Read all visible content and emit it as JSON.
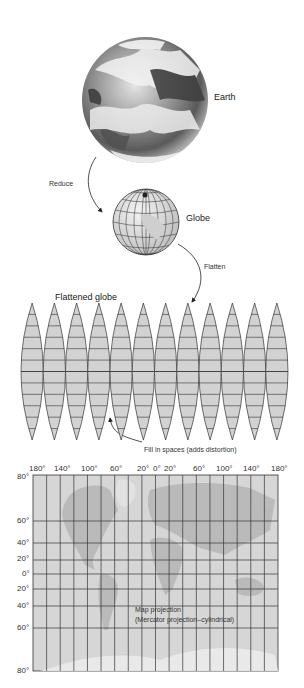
{
  "diagram": {
    "stages": [
      {
        "id": "earth",
        "label": "Earth"
      },
      {
        "id": "globe",
        "label": "Globe"
      },
      {
        "id": "flattened",
        "label": "Flattened globe"
      },
      {
        "id": "projection",
        "label": "Map projection",
        "sublabel": "(Mercator projection–cylindrical)"
      }
    ],
    "arrows": [
      {
        "from": "earth",
        "to": "globe",
        "label": "Reduce"
      },
      {
        "from": "globe",
        "to": "flattened",
        "label": "Flatten"
      },
      {
        "from": "flattened",
        "to": "projection",
        "label": "Fill in spaces (adds distortion)"
      }
    ]
  },
  "gores": {
    "count": 12
  },
  "map": {
    "longitude_labels": [
      "180°",
      "140°",
      "100°",
      "60°",
      "20°",
      "0°",
      "20°",
      "60°",
      "100°",
      "140°",
      "180°"
    ],
    "latitude_labels": [
      "80°",
      "60°",
      "40°",
      "20°",
      "0°",
      "20°",
      "40°",
      "60°",
      "80°"
    ]
  },
  "colors": {
    "map_fill": "#d4d4d4",
    "grid_line": "#333333",
    "earth_dark": "#4a4a4a",
    "earth_light": "#e8e8e8"
  }
}
